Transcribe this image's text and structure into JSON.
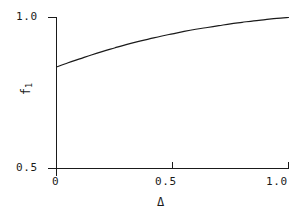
{
  "chart_data": {
    "type": "line",
    "title": "",
    "xlabel": "Δ",
    "ylabel": "f₁",
    "ylabel_base": "f",
    "ylabel_sub": "1",
    "xlim": [
      0,
      1.0
    ],
    "ylim": [
      0.5,
      1.0
    ],
    "grid": false,
    "legend": false,
    "xticks": [
      0,
      0.5,
      1.0
    ],
    "xtick_labels": [
      "0",
      "0.5",
      "1.0"
    ],
    "yticks": [
      0.5,
      1.0
    ],
    "ytick_labels": [
      "0.5",
      "1.0"
    ],
    "line_color": "#1a1a1a",
    "axis_color": "#1a1a1a",
    "background": "#ffffff",
    "series": [
      {
        "name": "f1",
        "x": [
          0.0,
          0.05,
          0.1,
          0.15,
          0.2,
          0.25,
          0.3,
          0.35,
          0.4,
          0.45,
          0.5,
          0.55,
          0.6,
          0.65,
          0.7,
          0.75,
          0.8,
          0.85,
          0.9,
          0.95,
          1.0
        ],
        "y": [
          0.836,
          0.85,
          0.863,
          0.876,
          0.888,
          0.899,
          0.91,
          0.92,
          0.929,
          0.938,
          0.946,
          0.954,
          0.961,
          0.967,
          0.973,
          0.979,
          0.984,
          0.989,
          0.993,
          0.997,
          1.0
        ]
      }
    ]
  },
  "axes": {
    "xtick_0": "0",
    "xtick_05": "0.5",
    "xtick_10": "1.0",
    "ytick_05": "0.5",
    "ytick_10": "1.0",
    "xaxis_title": "Δ",
    "yaxis_base": "f",
    "yaxis_sub": "1"
  }
}
